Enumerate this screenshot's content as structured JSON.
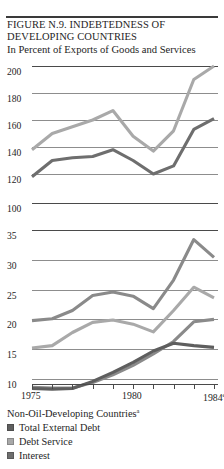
{
  "figure": {
    "title_line1": "FIGURE N.9. INDEBTEDNESS OF",
    "title_line2": "DEVELOPING COUNTRIES",
    "subtitle": "In Percent of Exports of Goods and Services"
  },
  "legend": {
    "heading": "Non-Oil-Developing Countries",
    "heading_marker": "a",
    "items": [
      {
        "label": "Total External Debt",
        "color": "#5f5f5f",
        "swatch_name": "legend-swatch-total-external-debt"
      },
      {
        "label": "Debt Service",
        "color": "#a8a8a8",
        "swatch_name": "legend-swatch-debt-service"
      },
      {
        "label": "Interest",
        "color": "#6e6e6e",
        "swatch_name": "legend-swatch-interest"
      }
    ]
  },
  "footnote_partial": "",
  "colors": {
    "light_gray_line": "#a9a9a9",
    "mid_gray_line": "#8a8a8a",
    "dark_gray_line": "#5e5e5e",
    "grid": "#8d8d8d",
    "axis": "#4a4a4a",
    "text": "#1e1e1e"
  },
  "chart_data": {
    "type": "line",
    "title": "FIGURE N.9. INDEBTEDNESS OF DEVELOPING COUNTRIES",
    "subtitle": "In Percent of Exports of Goods and Services",
    "xlabel": "",
    "ylabel": "In Percent of Exports of Goods and Services",
    "grid": true,
    "legend_position": "below-plot",
    "broken_axis": true,
    "axis_break_note": "Y axis is broken between 100 and 35; upper panel shows Total External Debt (120-200), lower panel shows Debt Service and Interest (10-35).",
    "x": [
      1975,
      1976,
      1977,
      1978,
      1979,
      1980,
      1981,
      1982,
      1983,
      1984
    ],
    "xtick_labels": [
      "1975",
      "",
      "",
      "",
      "",
      "1980",
      "",
      "",
      "",
      "1984e"
    ],
    "xtick_labels_shown": [
      "1975",
      "1980",
      "1984"
    ],
    "last_point_is_estimate": true,
    "panels": [
      {
        "name": "upper",
        "ylim": [
          120,
          200
        ],
        "yticks": [
          120,
          140,
          160,
          180,
          200
        ],
        "series": [
          {
            "name": "Total External Debt - Non-Oil-Developing Countries",
            "color": "#a9a9a9",
            "values": [
              138,
              150,
              155,
              160,
              167,
              148,
              137,
              152,
              190,
              200
            ]
          },
          {
            "name": "Total External Debt - All Developing Countries",
            "color": "#6e6e6e",
            "values": [
              118,
              130,
              132,
              133,
              138,
              130,
              120,
              126,
              153,
              161
            ]
          }
        ]
      },
      {
        "name": "lower",
        "ylim": [
          10,
          35
        ],
        "yticks": [
          10,
          15,
          20,
          25,
          30,
          35
        ],
        "series": [
          {
            "name": "Debt Service - upper",
            "color": "#8a8a8a",
            "values": [
              19.8,
              20.1,
              21.5,
              24.0,
              24.6,
              23.9,
              21.8,
              26.6,
              33.4,
              30.4
            ]
          },
          {
            "name": "Debt Service - lower",
            "color": "#a9a9a9",
            "values": [
              15.2,
              15.6,
              17.8,
              19.5,
              19.9,
              19.2,
              17.9,
              21.5,
              25.4,
              23.6
            ]
          },
          {
            "name": "Interest - upper",
            "color": "#8a8a8a",
            "values": [
              8.6,
              8.5,
              8.5,
              9.4,
              10.7,
              12.3,
              14.2,
              16.3,
              19.6,
              20.0
            ]
          },
          {
            "name": "Interest - lower",
            "color": "#5e5e5e",
            "values": [
              8.4,
              8.3,
              8.4,
              9.6,
              11.1,
              12.8,
              14.7,
              16.0,
              15.6,
              15.3
            ]
          }
        ]
      }
    ]
  }
}
